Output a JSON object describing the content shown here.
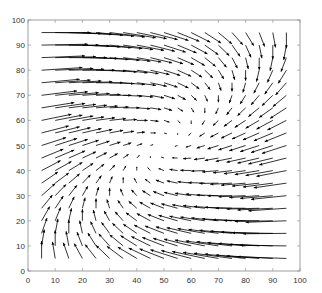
{
  "chart_data": {
    "type": "quiver",
    "title": "",
    "xlabel": "",
    "ylabel": "",
    "xlim": [
      0,
      100
    ],
    "ylim": [
      0,
      100
    ],
    "xticks": [
      0,
      10,
      20,
      30,
      40,
      50,
      60,
      70,
      80,
      90,
      100
    ],
    "yticks": [
      0,
      10,
      20,
      30,
      40,
      50,
      60,
      70,
      80,
      90,
      100
    ],
    "grid": false,
    "legend": null,
    "grid_points": {
      "x_start": 5,
      "x_end": 95,
      "y_start": 5,
      "y_end": 95,
      "step": 5
    },
    "field_description": "u ≈ k·(y − x), v ≈ k·(100 − x − y)·0.35; strongest rightward at top-left, strongest leftward at bottom-right, near-zero along diagonal",
    "arrow_color": "#000000"
  }
}
